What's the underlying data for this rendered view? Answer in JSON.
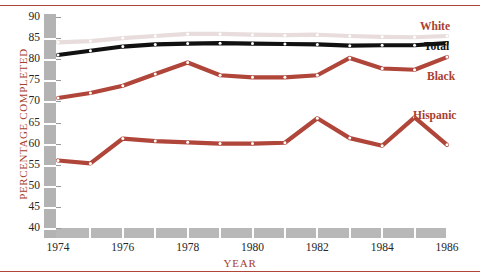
{
  "chart_data": {
    "type": "line",
    "title": "",
    "subtitle": "",
    "xlabel": "YEAR",
    "ylabel": "PERCENTAGE COMPLETED",
    "xlim": [
      1974,
      1986
    ],
    "ylim": [
      40,
      90
    ],
    "yticks": [
      40,
      45,
      50,
      55,
      60,
      65,
      70,
      75,
      80,
      85,
      90
    ],
    "xticks": [
      1974,
      1976,
      1978,
      1980,
      1982,
      1984,
      1986
    ],
    "xtick_labels": [
      "1974",
      "1976",
      "1978",
      "1980",
      "1982",
      "1984",
      "1986"
    ],
    "ytick_labels": [
      "40",
      "45",
      "50",
      "55",
      "60",
      "65",
      "70",
      "75",
      "80",
      "85",
      "90"
    ],
    "grid": false,
    "legend_position": "right-inline",
    "x": [
      1974,
      1975,
      1976,
      1977,
      1978,
      1979,
      1980,
      1981,
      1982,
      1983,
      1984,
      1985,
      1986
    ],
    "series": [
      {
        "name": "White",
        "color": "#e8dcdc",
        "marker": "circle-white",
        "values": [
          84.0,
          84.3,
          85.0,
          85.5,
          86.0,
          86.0,
          85.8,
          85.7,
          85.8,
          85.5,
          85.3,
          85.2,
          85.5
        ]
      },
      {
        "name": "Total",
        "color": "#111111",
        "marker": "circle-white",
        "values": [
          81.0,
          82.0,
          83.0,
          83.5,
          83.7,
          83.8,
          83.7,
          83.6,
          83.5,
          83.2,
          83.3,
          83.3,
          83.8
        ]
      },
      {
        "name": "Black",
        "color": "#b0453a",
        "marker": "circle-white",
        "values": [
          70.8,
          72.0,
          73.7,
          76.5,
          79.2,
          76.2,
          75.7,
          75.7,
          76.2,
          80.3,
          77.8,
          77.5,
          80.5
        ]
      },
      {
        "name": "Hispanic",
        "color": "#b0453a",
        "marker": "circle-white",
        "values": [
          56.0,
          55.3,
          61.2,
          60.6,
          60.3,
          60.0,
          60.0,
          60.2,
          66.0,
          61.3,
          59.5,
          66.2,
          59.7
        ]
      }
    ],
    "series_labels": [
      {
        "text": "White",
        "color": "#a83e30",
        "x": 420,
        "y": 20
      },
      {
        "text": "Total",
        "color": "#111111",
        "x": 424,
        "y": 40
      },
      {
        "text": "Black",
        "color": "#a83e30",
        "x": 427,
        "y": 70
      },
      {
        "text": "Hispanic",
        "color": "#a83e30",
        "x": 413,
        "y": 109
      }
    ]
  },
  "style": {
    "accent": "#b0453a",
    "axis_band": "#b3b3b3",
    "label_color": "#a83e30",
    "tick_color": "#262626"
  }
}
